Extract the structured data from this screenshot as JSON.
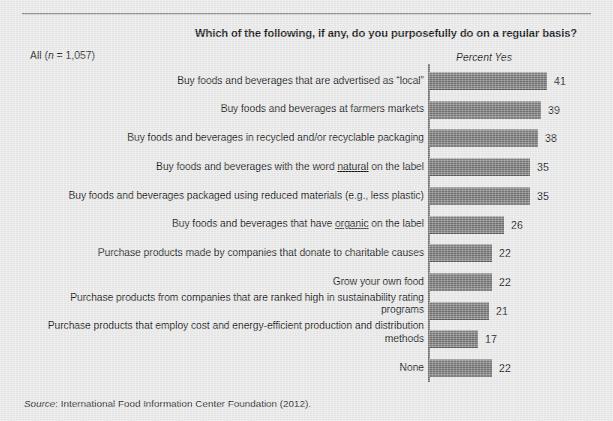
{
  "figure": {
    "title": "Which of the following, if any, do you purposefully do on a regular basis?",
    "sample_label_prefix": "All (",
    "sample_label_n": "n",
    "sample_label_suffix": " = 1,057)",
    "axis_caption": "Percent Yes",
    "source_word": "Source",
    "source_text": ": International Food Information Center Foundation (2012)."
  },
  "chart_data": {
    "type": "bar",
    "orientation": "horizontal",
    "title": "Which of the following, if any, do you purposefully do on a regular basis?",
    "subtitle": "All (n = 1,057)",
    "xlabel": "Percent Yes",
    "ylabel": "",
    "xlim": [
      0,
      41
    ],
    "grid": false,
    "legend": false,
    "value_suffix": "",
    "source": "Source: International Food Information Center Foundation (2012).",
    "categories": [
      "Buy foods and beverages that are advertised as “local”",
      "Buy foods and beverages at farmers markets",
      "Buy foods and beverages in recycled and/or recyclable packaging",
      "Buy foods and beverages with the word natural on the label",
      "Buy foods and beverages packaged using reduced materials (e.g., less plastic)",
      "Buy foods and beverages that have organic on the label",
      "Purchase products made by companies that donate to charitable causes",
      "Grow your own food",
      "Purchase products from companies that are ranked high in sustainability rating programs",
      "Purchase products that employ cost and energy-efficient production and distribution methods",
      "None"
    ],
    "values": [
      41,
      39,
      38,
      35,
      35,
      26,
      22,
      22,
      21,
      17,
      22
    ],
    "bars": [
      {
        "label_html": "Buy foods and beverages that are advertised as “local”",
        "value": 41,
        "lines": 1
      },
      {
        "label_html": "Buy foods and beverages at farmers markets",
        "value": 39,
        "lines": 1
      },
      {
        "label_html": "Buy foods and beverages in recycled and/or recyclable packaging",
        "value": 38,
        "lines": 1
      },
      {
        "label_html": "Buy foods and beverages with the word <u>natural</u> on the label",
        "value": 35,
        "lines": 1
      },
      {
        "label_html": "Buy foods and beverages packaged using reduced materials (e.g., less plastic)",
        "value": 35,
        "lines": 1
      },
      {
        "label_html": "Buy foods and beverages that have <u>organic</u> on the label",
        "value": 26,
        "lines": 1
      },
      {
        "label_html": "Purchase products made by companies that donate to charitable causes",
        "value": 22,
        "lines": 1
      },
      {
        "label_html": "Grow your own food",
        "value": 22,
        "lines": 1
      },
      {
        "label_html": "Purchase products from companies that are ranked high in sustainability rating programs",
        "value": 21,
        "lines": 2
      },
      {
        "label_html": "Purchase products that employ cost and energy-efficient production and distribution methods",
        "value": 17,
        "lines": 2
      },
      {
        "label_html": "None",
        "value": 22,
        "lines": 1
      }
    ],
    "colors": {
      "bar_fill": "#6e6e6e",
      "background": "#e9e9e9",
      "text": "#141414",
      "rule": "#8d8d8d",
      "axis": "#6e6e6e"
    }
  }
}
